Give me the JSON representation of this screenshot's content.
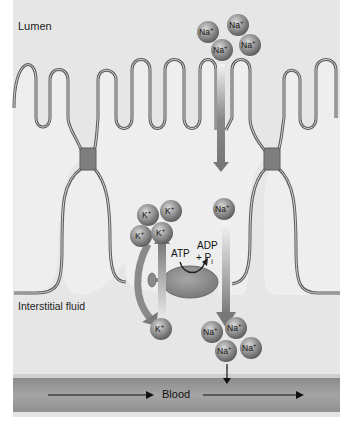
{
  "diagram": {
    "labels": {
      "lumen": "Lumen",
      "interstitial": "Interstitial fluid",
      "blood": "Blood",
      "atp": "ATP",
      "adp": "ADP",
      "pi": "+ P",
      "pi_sub": "i"
    },
    "ions": {
      "na_lumen": [
        "Na+",
        "Na+",
        "Na+",
        "Na+"
      ],
      "na_cell": "Na+",
      "k_cell": [
        "K+",
        "K+",
        "K+",
        "K+"
      ],
      "k_interstitial": "K+",
      "na_interstitial": [
        "Na+",
        "Na+",
        "Na+",
        "Na+"
      ]
    },
    "ion_text": {
      "na": "Na",
      "k": "K",
      "plus": "+"
    },
    "colors": {
      "background": "#e4e4e4",
      "membrane": "#6a6a6a",
      "cell_fill": "#efefef",
      "ion_fill": "#8c8c8c",
      "arrow": "#7a7a7a",
      "pump": "#8a8a8a",
      "blood_band": "#9a9a9a",
      "junction": "#7e7e7e"
    }
  }
}
